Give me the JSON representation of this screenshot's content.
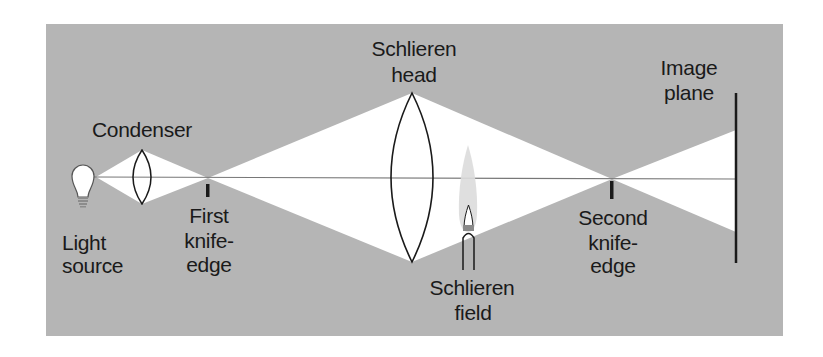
{
  "diagram": {
    "colors": {
      "background": "#b5b5b5",
      "light": "#ffffff",
      "ink": "#1a1a1a",
      "axis": "#777777",
      "flame_outer": "#dcdcdc",
      "flame_band": "#8a8a8a",
      "bulb_base": "#8c8c8c"
    },
    "labels": {
      "condenser": "Condenser",
      "light_source_line1": "Light",
      "light_source_line2": "source",
      "first_knife_line1": "First",
      "first_knife_line2": "knife-",
      "first_knife_line3": "edge",
      "schlieren_head_line1": "Schlieren",
      "schlieren_head_line2": "head",
      "schlieren_field_line1": "Schlieren",
      "schlieren_field_line2": "field",
      "second_knife_line1": "Second",
      "second_knife_line2": "knife-",
      "second_knife_line3": "edge",
      "image_plane_line1": "Image",
      "image_plane_line2": "plane"
    },
    "components": [
      {
        "name": "Light source",
        "icon": "light-bulb-icon"
      },
      {
        "name": "Condenser",
        "icon": "convex-lens-icon"
      },
      {
        "name": "First knife-edge",
        "icon": "knife-edge-icon"
      },
      {
        "name": "Schlieren head",
        "icon": "convex-lens-icon"
      },
      {
        "name": "Schlieren field",
        "icon": "bunsen-flame-icon"
      },
      {
        "name": "Second knife-edge",
        "icon": "knife-edge-icon"
      },
      {
        "name": "Image plane",
        "icon": "screen-line-icon"
      }
    ]
  }
}
